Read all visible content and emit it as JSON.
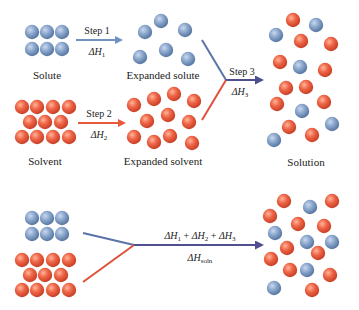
{
  "colors": {
    "solute": "#7e9cc4",
    "solute_dark": "#4f6f9a",
    "solvent": "#ea5a3e",
    "solvent_dark": "#c23a22",
    "step1_arrow": "#6f93c0",
    "step2_arrow": "#e8593c",
    "step3_arrow": "#4e4f8c",
    "blue_line": "#5a74a8",
    "red_line": "#e0503a",
    "text": "#222222"
  },
  "labels": {
    "solute": "Solute",
    "expanded_solute": "Expanded solute",
    "solvent": "Solvent",
    "expanded_solvent": "Expanded solvent",
    "solution": "Solution"
  },
  "steps": {
    "step1": {
      "label": "Step 1",
      "delta": "ΔH",
      "sub": "1"
    },
    "step2": {
      "label": "Step 2",
      "delta": "ΔH",
      "sub": "2"
    },
    "step3": {
      "label": "Step 3",
      "delta": "ΔH",
      "sub": "3"
    }
  },
  "overall": {
    "sum_parts": [
      {
        "delta": "ΔH",
        "sub": "1"
      },
      {
        "op": " + "
      },
      {
        "delta": "ΔH",
        "sub": "2"
      },
      {
        "op": " + "
      },
      {
        "delta": "ΔH",
        "sub": "3"
      }
    ],
    "result_delta": "ΔH",
    "result_sub": "soln"
  },
  "particles": {
    "solute": [
      [
        32,
        32
      ],
      [
        47,
        32
      ],
      [
        62,
        32
      ],
      [
        32,
        49
      ],
      [
        47,
        49
      ],
      [
        62,
        49
      ]
    ],
    "expanded_solute": [
      [
        145,
        32
      ],
      [
        161,
        21
      ],
      [
        185,
        30
      ],
      [
        140,
        57
      ],
      [
        166,
        50
      ],
      [
        188,
        59
      ]
    ],
    "solvent": [
      [
        22,
        107
      ],
      [
        37,
        107
      ],
      [
        53,
        107
      ],
      [
        69,
        107
      ],
      [
        30,
        122
      ],
      [
        45,
        122
      ],
      [
        61,
        122
      ],
      [
        22,
        137
      ],
      [
        37,
        137
      ],
      [
        53,
        137
      ],
      [
        69,
        137
      ]
    ],
    "expanded_solvent": [
      [
        134,
        105
      ],
      [
        154,
        99
      ],
      [
        174,
        94
      ],
      [
        194,
        101
      ],
      [
        147,
        121
      ],
      [
        168,
        115
      ],
      [
        189,
        122
      ],
      [
        134,
        137
      ],
      [
        154,
        142
      ],
      [
        170,
        136
      ],
      [
        192,
        143
      ]
    ],
    "solution_blue": [
      [
        316,
        25
      ],
      [
        276,
        35
      ],
      [
        300,
        67
      ],
      [
        302,
        111
      ],
      [
        332,
        124
      ],
      [
        274,
        140
      ]
    ],
    "solution_red": [
      [
        293,
        20
      ],
      [
        301,
        41
      ],
      [
        331,
        44
      ],
      [
        280,
        62
      ],
      [
        325,
        70
      ],
      [
        286,
        88
      ],
      [
        306,
        87
      ],
      [
        277,
        104
      ],
      [
        324,
        102
      ],
      [
        289,
        127
      ],
      [
        312,
        135
      ]
    ],
    "bottom_solute": [
      [
        32,
        218
      ],
      [
        47,
        218
      ],
      [
        62,
        218
      ],
      [
        32,
        234
      ],
      [
        47,
        234
      ],
      [
        62,
        234
      ]
    ],
    "bottom_solvent": [
      [
        22,
        260
      ],
      [
        37,
        260
      ],
      [
        53,
        260
      ],
      [
        69,
        260
      ],
      [
        30,
        275
      ],
      [
        45,
        275
      ],
      [
        61,
        275
      ],
      [
        22,
        290
      ],
      [
        37,
        290
      ],
      [
        53,
        290
      ],
      [
        69,
        290
      ]
    ],
    "bottom_solution_blue": [
      [
        310,
        207
      ],
      [
        275,
        233
      ],
      [
        307,
        242
      ],
      [
        332,
        242
      ],
      [
        307,
        270
      ],
      [
        274,
        288
      ]
    ],
    "bottom_solution_red": [
      [
        284,
        201
      ],
      [
        332,
        201
      ],
      [
        270,
        216
      ],
      [
        298,
        224
      ],
      [
        324,
        226
      ],
      [
        287,
        248
      ],
      [
        318,
        253
      ],
      [
        271,
        259
      ],
      [
        290,
        270
      ],
      [
        330,
        275
      ],
      [
        312,
        290
      ]
    ]
  }
}
